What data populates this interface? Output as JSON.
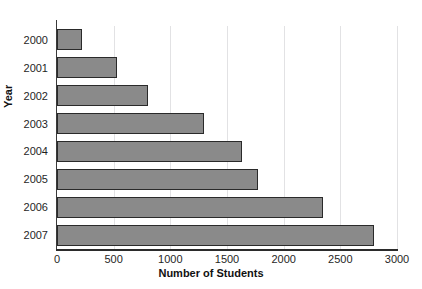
{
  "chart_data": {
    "type": "bar",
    "orientation": "horizontal",
    "title": "",
    "xlabel": "Number of Students",
    "ylabel": "Year",
    "categories": [
      "2000",
      "2001",
      "2002",
      "2003",
      "2004",
      "2005",
      "2006",
      "2007"
    ],
    "values": [
      220,
      530,
      800,
      1300,
      1630,
      1770,
      2350,
      2800
    ],
    "xlim": [
      0,
      3000
    ],
    "xticks": [
      "0",
      "500",
      "1000",
      "1500",
      "2000",
      "2500",
      "3000"
    ],
    "xtick_values": [
      0,
      500,
      1000,
      1500,
      2000,
      2500,
      3000
    ],
    "grid": "vertical",
    "legend": "none",
    "bar_fill_color": "#8a8a8a",
    "bar_border_color": "#2a2a2a",
    "gridline_color": "#e2e2e4",
    "axis_color": "#2b2b2b",
    "background_color": "#ffffff"
  }
}
